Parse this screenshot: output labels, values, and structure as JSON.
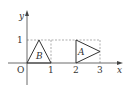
{
  "diagram": {
    "type": "coordinate-plane",
    "axes": {
      "x_label": "x",
      "y_label": "y",
      "origin_label": "O"
    },
    "ticks": {
      "x": [
        "1",
        "2",
        "3"
      ],
      "y": [
        "1"
      ]
    },
    "shapes": [
      {
        "label": "B",
        "kind": "triangle",
        "vertices": [
          [
            0,
            0
          ],
          [
            0.5,
            1
          ],
          [
            1,
            0
          ]
        ]
      },
      {
        "label": "A",
        "kind": "triangle",
        "vertices": [
          [
            2,
            0
          ],
          [
            2,
            1
          ],
          [
            3,
            0.5
          ]
        ]
      }
    ],
    "colors": {
      "axis": "#444444",
      "shape": "#333333",
      "dashed": "#777777"
    }
  }
}
